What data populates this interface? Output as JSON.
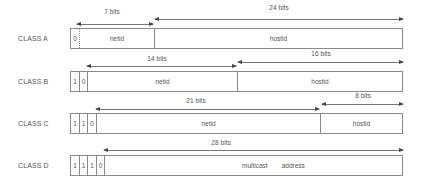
{
  "diagram": {
    "classes": [
      {
        "label": "CLASS A",
        "prefix_bits": [
          "0"
        ],
        "fields": [
          "netid",
          "hostid"
        ],
        "arrows": [
          {
            "value": "7",
            "unit": "bits"
          },
          {
            "value": "24",
            "unit": "bits"
          }
        ]
      },
      {
        "label": "CLASS B",
        "prefix_bits": [
          "1",
          "0"
        ],
        "fields": [
          "netid",
          "hostid"
        ],
        "arrows": [
          {
            "value": "14",
            "unit": "bits"
          },
          {
            "value": "16",
            "unit": "bits"
          }
        ]
      },
      {
        "label": "CLASS C",
        "prefix_bits": [
          "1",
          "1",
          "0"
        ],
        "fields": [
          "netid",
          "hostid"
        ],
        "arrows": [
          {
            "value": "21",
            "unit": "bits"
          },
          {
            "value": "8",
            "unit": "bits"
          }
        ]
      },
      {
        "label": "CLASS D",
        "prefix_bits": [
          "1",
          "1",
          "1",
          "0"
        ],
        "fields": [
          "multicast",
          "address"
        ],
        "arrows": [
          {
            "value": "28",
            "unit": "bits"
          }
        ]
      }
    ],
    "colors": {
      "line": "#8a8a8a",
      "text": "#555555",
      "arrowhead": "#444444"
    }
  }
}
